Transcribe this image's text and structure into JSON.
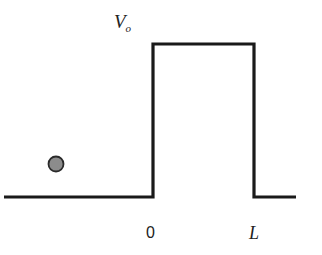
{
  "diagram": {
    "colors": {
      "line": "#1a1a1a",
      "particle_fill": "#8c8c8c",
      "particle_stroke": "#2a2a2a",
      "background": "#ffffff"
    },
    "labels": {
      "barrier_height_main": "V",
      "barrier_height_sub": "o",
      "left_edge": "0",
      "right_edge": "L"
    },
    "geometry": {
      "ground_y": 197,
      "left_ground_start_x": 4,
      "barrier_left_x": 153,
      "barrier_right_x": 254,
      "barrier_top_y": 44,
      "right_ground_end_x": 296,
      "particle": {
        "cx": 56,
        "cy": 164,
        "r": 7.5
      }
    }
  }
}
